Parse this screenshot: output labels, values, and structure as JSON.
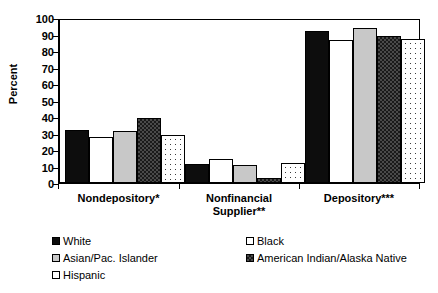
{
  "chart_data": {
    "type": "bar",
    "title": "",
    "subtitle": "",
    "xlabel": "",
    "ylabel": "Percent",
    "ylim": [
      0,
      100
    ],
    "ytick_step": 10,
    "yticks": [
      0,
      10,
      20,
      30,
      40,
      50,
      60,
      70,
      80,
      90,
      100
    ],
    "grid": false,
    "legend_position": "bottom",
    "categories": [
      "Nondepository*",
      "Nonfinancial Supplier**",
      "Depository***"
    ],
    "series": [
      {
        "name": "White",
        "pattern": "solid-black",
        "values": [
          32.5,
          11.5,
          93.5
        ]
      },
      {
        "name": "Black",
        "pattern": "open-white",
        "values": [
          28.0,
          15.0,
          88.0
        ]
      },
      {
        "name": "Asian/Pac. Islander",
        "pattern": "light-gray",
        "values": [
          32.0,
          11.0,
          95.0
        ]
      },
      {
        "name": "American Indian/Alaska Native",
        "pattern": "checkered",
        "values": [
          40.0,
          3.0,
          90.5
        ]
      },
      {
        "name": "Hispanic",
        "pattern": "dotted",
        "values": [
          29.5,
          12.0,
          88.5
        ]
      }
    ],
    "colors": {
      "white_series": "#0d0d0d",
      "black_series": "#ffffff",
      "asian_series": "#c8c8c8",
      "amerind_series": "#3a3a3a",
      "hispanic_series": "#ffffff",
      "axis": "#000000",
      "background": "#ffffff"
    }
  },
  "axis": {
    "y_title": "Percent",
    "y_tick_labels": [
      "100",
      "90",
      "80",
      "70",
      "60",
      "50",
      "40",
      "30",
      "20",
      "10",
      "0"
    ],
    "x_tick_labels": [
      {
        "line1": "Nondepository*",
        "line2": ""
      },
      {
        "line1": "Nonfinancial",
        "line2": "Supplier**"
      },
      {
        "line1": "Depository***",
        "line2": ""
      }
    ]
  },
  "legend": {
    "items": [
      {
        "label": "White",
        "swatch": "solid-black-swatch"
      },
      {
        "label": "Black",
        "swatch": "open-white-swatch"
      },
      {
        "label": "Asian/Pac. Islander",
        "swatch": "light-gray-swatch"
      },
      {
        "label": "American Indian/Alaska Native",
        "swatch": "checkered-swatch"
      },
      {
        "label": "Hispanic",
        "swatch": "open-white-swatch"
      }
    ]
  }
}
